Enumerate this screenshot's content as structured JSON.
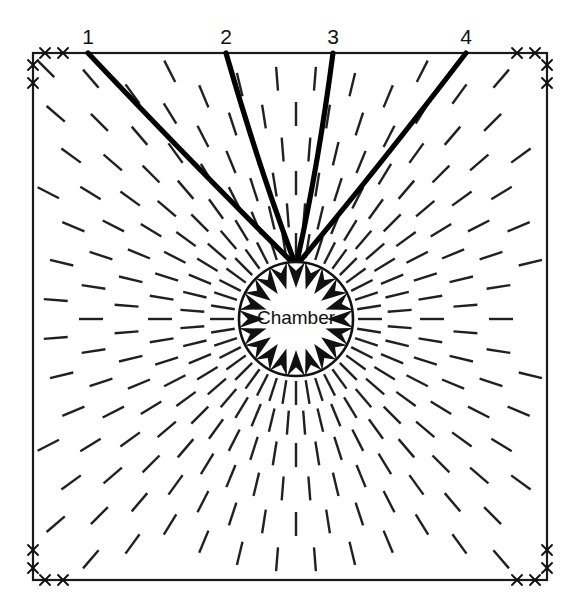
{
  "diagram": {
    "chamber": {
      "label": "Chamber",
      "cx": 296,
      "cy": 319,
      "r": 57,
      "arrow_count": 20,
      "arrow_length": 26,
      "arrow_half_width": 9,
      "stroke_color": "#111111",
      "fill_color": "#ffffff"
    },
    "frame": {
      "left": 33,
      "top": 53,
      "right": 547,
      "bottom": 580,
      "stroke_color": "#1a1a1a",
      "corner_marker_glyph": "x",
      "corner_marker_count_per_edge": 2,
      "corner_marker_offsets": [
        12,
        30
      ]
    },
    "major_fractures": [
      {
        "label": "1",
        "x_top": 88,
        "y_top": 53,
        "label_x": 88,
        "label_y": 44
      },
      {
        "label": "2",
        "x_top": 226,
        "y_top": 53,
        "label_x": 226,
        "label_y": 44
      },
      {
        "label": "3",
        "x_top": 333,
        "y_top": 53,
        "label_x": 333,
        "label_y": 44
      },
      {
        "label": "4",
        "x_top": 466,
        "y_top": 53,
        "label_x": 466,
        "label_y": 44
      }
    ],
    "radial_dashes": {
      "description": "concentric rings of short radial segments pointing at chamber center",
      "ray_count": 40,
      "ring_radii": [
        74,
        104,
        136,
        170,
        205,
        241,
        278,
        316,
        354
      ],
      "segment_length": 24,
      "stroke_color": "#202020",
      "stroke_width": 2.4
    },
    "colors": {
      "background": "#ffffff",
      "ink": "#111111",
      "dash": "#202020"
    }
  }
}
